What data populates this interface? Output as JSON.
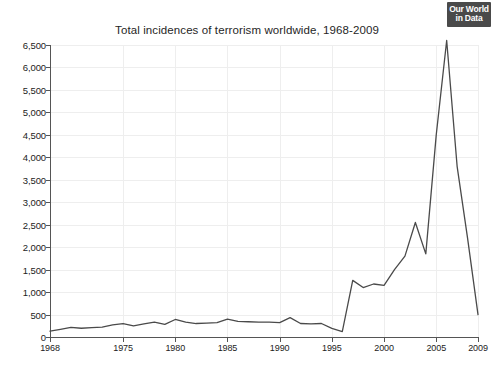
{
  "logo": {
    "line1": "Our World",
    "line2": "in Data",
    "name": "our-world-in-data-logo",
    "background": "#4a4a4a",
    "text_color": "#ffffff"
  },
  "chart_data": {
    "type": "line",
    "title": "Total incidences of terrorism worldwide, 1968-2009",
    "xlabel": "",
    "ylabel": "",
    "xlim": [
      1968,
      2009
    ],
    "ylim": [
      0,
      6500
    ],
    "grid": true,
    "legend": null,
    "line_color": "#4a4a4a",
    "axis_color": "#555555",
    "grid_color": "#eeeeee",
    "y_ticks": [
      0,
      500,
      1000,
      1500,
      2000,
      2500,
      3000,
      3500,
      4000,
      4500,
      5000,
      5500,
      6000,
      6500
    ],
    "y_tick_labels": [
      "0",
      "500",
      "1,000",
      "1,500",
      "2,000",
      "2,500",
      "3,000",
      "3,500",
      "4,000",
      "4,500",
      "5,000",
      "5,500",
      "6,000",
      "6,500"
    ],
    "x_ticks": [
      1968,
      1975,
      1980,
      1985,
      1990,
      1995,
      2000,
      2005,
      2009
    ],
    "x_tick_labels": [
      "1968",
      "1975",
      "1980",
      "1985",
      "1990",
      "1995",
      "2000",
      "2005",
      "2009"
    ],
    "x": [
      1968,
      1969,
      1970,
      1971,
      1972,
      1973,
      1974,
      1975,
      1976,
      1977,
      1978,
      1979,
      1980,
      1981,
      1982,
      1983,
      1984,
      1985,
      1986,
      1987,
      1988,
      1989,
      1990,
      1991,
      1992,
      1993,
      1994,
      1995,
      1996,
      1997,
      1998,
      1999,
      2000,
      2001,
      2002,
      2003,
      2004,
      2005,
      2006,
      2007,
      2008,
      2009
    ],
    "values": [
      130,
      170,
      215,
      195,
      210,
      220,
      270,
      300,
      250,
      290,
      330,
      280,
      390,
      330,
      300,
      310,
      320,
      400,
      350,
      340,
      330,
      330,
      320,
      430,
      300,
      290,
      300,
      190,
      120,
      1260,
      1100,
      1180,
      1150,
      1500,
      1800,
      2550,
      1850,
      4500,
      6600,
      3800,
      2200,
      500
    ],
    "annotations": []
  }
}
